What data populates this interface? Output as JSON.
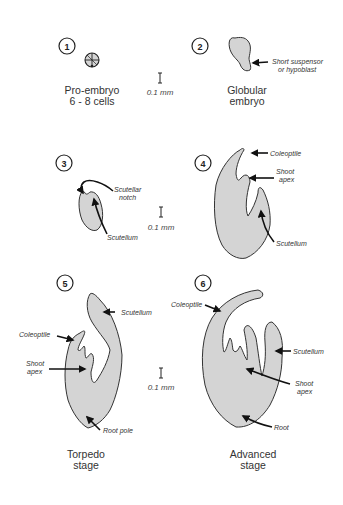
{
  "diagram": {
    "colors": {
      "fill": "#d4d4d4",
      "stroke": "#333333",
      "text": "#333333"
    },
    "scale_bar": "0.1 mm",
    "stages": [
      {
        "number": "1",
        "caption_line1": "Pro-embryo",
        "caption_line2": "6  -  8  cells"
      },
      {
        "number": "2",
        "caption_line1": "Globular",
        "caption_line2": "embryo",
        "labels": {
          "suspensor_line1": "Short  suspensor",
          "suspensor_line2": "or  hypoblast"
        }
      },
      {
        "number": "3",
        "labels": {
          "notch_line1": "Scutellar",
          "notch_line2": "notch",
          "scutellum": "Scutellum"
        }
      },
      {
        "number": "4",
        "labels": {
          "coleoptile": "Coleoptile",
          "shoot_line1": "Shoot",
          "shoot_line2": "apex",
          "scutellum": "Scutellum"
        }
      },
      {
        "number": "5",
        "caption_line1": "Torpedo",
        "caption_line2": "stage",
        "labels": {
          "scutellum": "Scutellum",
          "coleoptile": "Coleoptile",
          "shoot_line1": "Shoot",
          "shoot_line2": "apex",
          "root": "Root  pole"
        }
      },
      {
        "number": "6",
        "caption_line1": "Advanced",
        "caption_line2": "stage",
        "labels": {
          "coleoptile": "Coleoptile",
          "scutellum": "Scutellum",
          "shoot_line1": "Shoot",
          "shoot_line2": "apex",
          "root": "Root"
        }
      }
    ]
  }
}
